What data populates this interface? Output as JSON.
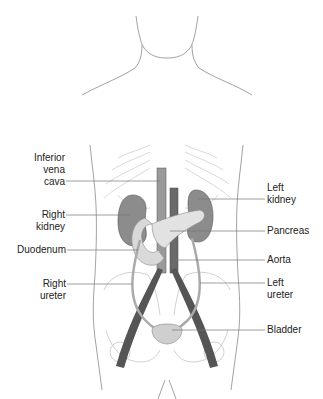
{
  "labels_left": [
    {
      "id": "inferior-vena-cava",
      "lines": [
        "Inferior",
        "vena",
        "cava"
      ]
    },
    {
      "id": "right-kidney",
      "lines": [
        "Right",
        "kidney"
      ]
    },
    {
      "id": "duodenum",
      "lines": [
        "Duodenum"
      ]
    },
    {
      "id": "right-ureter",
      "lines": [
        "Right",
        "ureter"
      ]
    }
  ],
  "labels_right": [
    {
      "id": "left-kidney",
      "lines": [
        "Left",
        "kidney"
      ]
    },
    {
      "id": "pancreas",
      "lines": [
        "Pancreas"
      ]
    },
    {
      "id": "aorta",
      "lines": [
        "Aorta"
      ]
    },
    {
      "id": "left-ureter",
      "lines": [
        "Left",
        "ureter"
      ]
    },
    {
      "id": "bladder",
      "lines": [
        "Bladder"
      ]
    }
  ],
  "colors": {
    "outline": "#8a8a8a",
    "kidney": "#8c8c8c",
    "vessel": "#5a5a5a",
    "pancreas": "#d9d9d9",
    "leader": "#777777"
  }
}
